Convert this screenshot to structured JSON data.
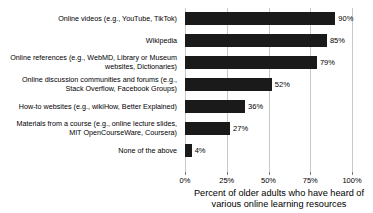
{
  "chart_data": {
    "type": "bar",
    "orientation": "horizontal",
    "title": "",
    "xlabel": "Percent of older adults who have heard of various online learning resources",
    "ylabel": "",
    "xlim": [
      0,
      100
    ],
    "grid": true,
    "legend": "none",
    "bar_color": "#1a1a1a",
    "gridline_color": "#c8c8c8",
    "categories": [
      "Online videos (e.g., YouTube, TikTok)",
      "Wikipedia",
      "Online references (e.g., WebMD, Library or Museum\nwebsites, Dictionaries)",
      "Online discussion communities and forums (e.g.,\nStack Overflow, Facebook Groups)",
      "How-to websites (e.g., wikiHow, Better Explained)",
      "Materials from a course (e.g., online lecture slides,\nMIT OpenCourseWare, Coursera)",
      "None of the above"
    ],
    "values": [
      90,
      85,
      79,
      52,
      36,
      27,
      4
    ],
    "value_labels": [
      "90%",
      "85%",
      "79%",
      "52%",
      "36%",
      "27%",
      "4%"
    ],
    "xticks": [
      0,
      25,
      50,
      75,
      100
    ],
    "xtick_labels": [
      "0%",
      "25%",
      "50%",
      "75%",
      "100%"
    ]
  },
  "axis_title_lines": [
    "Percent of older adults who have heard of",
    "various online learning resources"
  ]
}
